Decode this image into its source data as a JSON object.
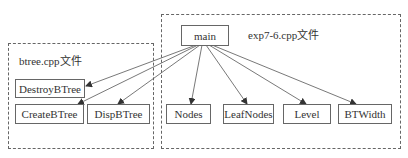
{
  "groups": {
    "btree": {
      "label": "btree.cpp文件"
    },
    "exp": {
      "label": "exp7-6.cpp文件"
    }
  },
  "nodes": {
    "main": "main",
    "destroy": "DestroyBTree",
    "create": "CreateBTree",
    "disp": "DispBTree",
    "nodes": "Nodes",
    "leafnodes": "LeafNodes",
    "level": "Level",
    "btwidth": "BTWidth"
  },
  "edges": [
    {
      "from": "main",
      "to": "DestroyBTree"
    },
    {
      "from": "main",
      "to": "CreateBTree"
    },
    {
      "from": "main",
      "to": "DispBTree"
    },
    {
      "from": "main",
      "to": "Nodes"
    },
    {
      "from": "main",
      "to": "LeafNodes"
    },
    {
      "from": "main",
      "to": "Level"
    },
    {
      "from": "main",
      "to": "BTWidth"
    }
  ],
  "colors": {
    "line": "#555555",
    "text": "#333333"
  }
}
